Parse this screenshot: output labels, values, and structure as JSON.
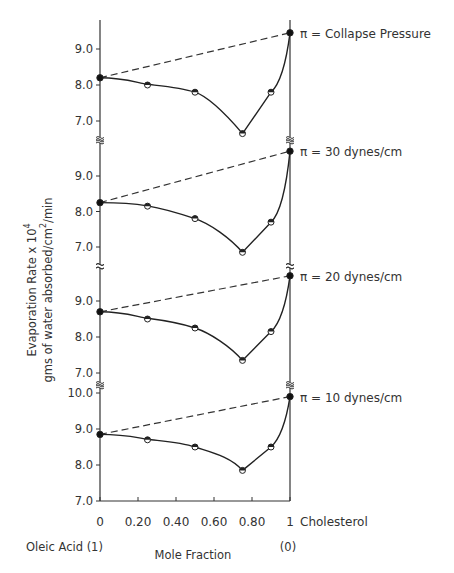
{
  "chart_data": {
    "type": "line",
    "title": "",
    "ylabel_line1": "Evaporation Rate x 10",
    "ylabel_sup": "4",
    "ylabel_line2_prefix": "gms of water absorbed/cm",
    "ylabel_line2_sup": "2",
    "ylabel_line2_suffix": "/min",
    "xlabel": "Mole Fraction",
    "x_left_label": "Oleic Acid (1)",
    "x_right_label": "(0)",
    "x_end_label": "Cholesterol",
    "xticks": [
      0,
      0.2,
      0.4,
      0.6,
      0.8,
      1
    ],
    "xtick_labels": [
      "0",
      "0.20",
      "0.40",
      "0.60",
      "0.80",
      "1"
    ],
    "xlim": [
      0,
      1
    ],
    "grid": false,
    "legend": "none",
    "panels": [
      {
        "label": "π = Collapse Pressure",
        "yticks": [
          7.0,
          8.0,
          9.0
        ],
        "ytick_labels": [
          "7.0",
          "8.0",
          "9.0"
        ],
        "ylim": [
          6.5,
          9.6
        ],
        "measured": {
          "x": [
            0,
            0.25,
            0.5,
            0.75,
            0.9,
            1
          ],
          "y": [
            8.2,
            8.0,
            7.8,
            6.65,
            7.8,
            9.45
          ]
        },
        "ideal_line": {
          "x": [
            0,
            1
          ],
          "y": [
            8.2,
            9.45
          ]
        }
      },
      {
        "label": "π = 30 dynes/cm",
        "yticks": [
          7.0,
          8.0,
          9.0
        ],
        "ytick_labels": [
          "7.0",
          "8.0",
          "9.0"
        ],
        "ylim": [
          6.5,
          9.9
        ],
        "measured": {
          "x": [
            0,
            0.25,
            0.5,
            0.75,
            0.9,
            1
          ],
          "y": [
            8.25,
            8.15,
            7.8,
            6.85,
            7.7,
            9.7
          ]
        },
        "ideal_line": {
          "x": [
            0,
            1
          ],
          "y": [
            8.25,
            9.7
          ]
        }
      },
      {
        "label": "π = 20 dynes/cm",
        "yticks": [
          7.0,
          8.0,
          9.0
        ],
        "ytick_labels": [
          "7.0",
          "8.0",
          "9.0"
        ],
        "ylim": [
          6.9,
          9.9
        ],
        "measured": {
          "x": [
            0,
            0.25,
            0.5,
            0.75,
            0.9,
            1
          ],
          "y": [
            8.7,
            8.5,
            8.25,
            7.35,
            8.15,
            9.7
          ]
        },
        "ideal_line": {
          "x": [
            0,
            1
          ],
          "y": [
            8.7,
            9.7
          ]
        }
      },
      {
        "label": "π = 10 dynes/cm",
        "yticks": [
          7.0,
          8.0,
          9.0,
          10.0
        ],
        "ytick_labels": [
          "7.0",
          "8.0",
          "9.0",
          "10.0"
        ],
        "ylim": [
          7.0,
          10.0
        ],
        "measured": {
          "x": [
            0,
            0.25,
            0.5,
            0.75,
            0.9,
            1
          ],
          "y": [
            8.85,
            8.7,
            8.5,
            7.85,
            8.5,
            9.9
          ]
        },
        "ideal_line": {
          "x": [
            0,
            1
          ],
          "y": [
            8.85,
            9.9
          ]
        }
      }
    ]
  }
}
